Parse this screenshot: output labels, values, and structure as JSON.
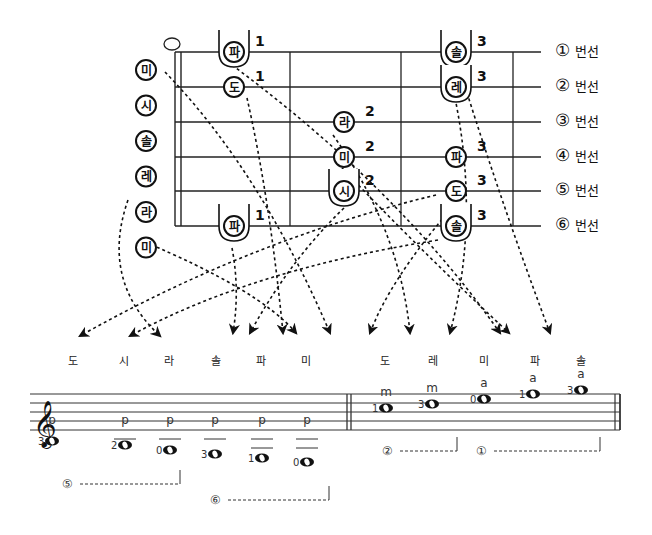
{
  "fretboard": {
    "strings": [
      {
        "num": "①",
        "label": "번선"
      },
      {
        "num": "②",
        "label": "번선"
      },
      {
        "num": "③",
        "label": "번선"
      },
      {
        "num": "④",
        "label": "번선"
      },
      {
        "num": "⑤",
        "label": "번선"
      },
      {
        "num": "⑥",
        "label": "번선"
      }
    ],
    "open_notes": [
      "미",
      "시",
      "솔",
      "레",
      "라",
      "미"
    ],
    "fretted_notes": [
      {
        "note": "파",
        "string": 1,
        "fret": 1,
        "finger": "1",
        "capo": true
      },
      {
        "note": "도",
        "string": 2,
        "fret": 1,
        "finger": "1",
        "capo": false
      },
      {
        "note": "라",
        "string": 3,
        "fret": 2,
        "finger": "2",
        "capo": false
      },
      {
        "note": "미",
        "string": 4,
        "fret": 2,
        "finger": "2",
        "capo": false
      },
      {
        "note": "시",
        "string": 5,
        "fret": 2,
        "finger": "2",
        "capo": true
      },
      {
        "note": "파",
        "string": 6,
        "fret": 1,
        "finger": "1",
        "capo": true
      },
      {
        "note": "솔",
        "string": 1,
        "fret": 3,
        "finger": "3",
        "capo": true
      },
      {
        "note": "레",
        "string": 2,
        "fret": 3,
        "finger": "3",
        "capo": true
      },
      {
        "note": "파",
        "string": 4,
        "fret": 3,
        "finger": "3",
        "capo": false
      },
      {
        "note": "도",
        "string": 5,
        "fret": 3,
        "finger": "3",
        "capo": false
      },
      {
        "note": "솔",
        "string": 6,
        "fret": 3,
        "finger": "3",
        "capo": true
      }
    ]
  },
  "staff": {
    "left_names": [
      "도",
      "시",
      "라",
      "솔",
      "파",
      "미"
    ],
    "right_names": [
      "도",
      "레",
      "미",
      "파",
      "솔"
    ],
    "left_notes": [
      {
        "fingering": "3",
        "pluck": "p",
        "x": 52,
        "y": 441,
        "ledger": 0
      },
      {
        "fingering": "2",
        "pluck": "p",
        "x": 125,
        "y": 445,
        "ledger": 1
      },
      {
        "fingering": "0",
        "pluck": "p",
        "x": 170,
        "y": 450,
        "ledger": 1
      },
      {
        "fingering": "3",
        "pluck": "p",
        "x": 215,
        "y": 454,
        "ledger": 1
      },
      {
        "fingering": "1",
        "pluck": "p",
        "x": 262,
        "y": 458,
        "ledger": 2
      },
      {
        "fingering": "0",
        "pluck": "p",
        "x": 307,
        "y": 462,
        "ledger": 2
      }
    ],
    "right_notes": [
      {
        "fingering": "1",
        "pluck": "m",
        "x": 386,
        "y": 408
      },
      {
        "fingering": "3",
        "pluck": "m",
        "x": 432,
        "y": 404
      },
      {
        "fingering": "0",
        "pluck": "a",
        "x": 484,
        "y": 399
      },
      {
        "fingering": "1",
        "pluck": "a",
        "x": 533,
        "y": 394
      },
      {
        "fingering": "3",
        "pluck": "a",
        "x": 581,
        "y": 390
      }
    ],
    "brackets": [
      {
        "num": "⑤",
        "x1": 80,
        "x2": 180,
        "y": 484
      },
      {
        "num": "⑥",
        "x1": 228,
        "x2": 329,
        "y": 500
      },
      {
        "num": "②",
        "x1": 400,
        "x2": 457,
        "y": 451
      },
      {
        "num": "①",
        "x1": 494,
        "x2": 600,
        "y": 451
      }
    ]
  },
  "colors": {
    "ink": "#111111",
    "paper": "#ffffff"
  }
}
